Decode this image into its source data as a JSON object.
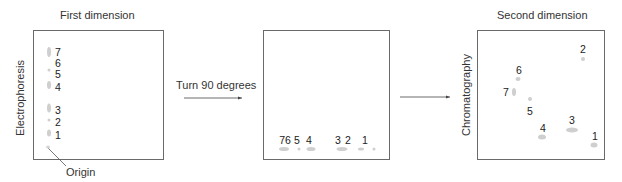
{
  "panels": [
    {
      "title": "First dimension",
      "axis_label": "Electrophoresis",
      "labels": [
        {
          "text": "7",
          "x": 58,
          "y": 52
        },
        {
          "text": "6",
          "x": 58,
          "y": 63
        },
        {
          "text": "5",
          "x": 58,
          "y": 74
        },
        {
          "text": "4",
          "x": 58,
          "y": 87
        },
        {
          "text": "3",
          "x": 58,
          "y": 110
        },
        {
          "text": "2",
          "x": 58,
          "y": 122
        },
        {
          "text": "1",
          "x": 58,
          "y": 135
        }
      ],
      "spots": [
        {
          "x": 49,
          "y": 52,
          "w": 4,
          "h": 10
        },
        {
          "x": 49,
          "y": 70,
          "w": 3,
          "h": 3
        },
        {
          "x": 49,
          "y": 85,
          "w": 4,
          "h": 8
        },
        {
          "x": 49,
          "y": 108,
          "w": 4,
          "h": 9
        },
        {
          "x": 49,
          "y": 120,
          "w": 3,
          "h": 3
        },
        {
          "x": 49,
          "y": 133,
          "w": 4,
          "h": 7
        }
      ],
      "origin_label": "Origin"
    },
    {
      "title": "",
      "labels": [
        {
          "text": "76",
          "x": 285,
          "y": 140
        },
        {
          "text": "5",
          "x": 297,
          "y": 140
        },
        {
          "text": "4",
          "x": 309,
          "y": 140
        },
        {
          "text": "3",
          "x": 338,
          "y": 140
        },
        {
          "text": "2",
          "x": 348,
          "y": 140
        },
        {
          "text": "1",
          "x": 365,
          "y": 140
        }
      ],
      "spots": [
        {
          "x": 284,
          "y": 149,
          "w": 10,
          "h": 4
        },
        {
          "x": 299,
          "y": 149,
          "w": 3,
          "h": 3
        },
        {
          "x": 311,
          "y": 149,
          "w": 9,
          "h": 4
        },
        {
          "x": 342,
          "y": 149,
          "w": 11,
          "h": 4
        },
        {
          "x": 361,
          "y": 149,
          "w": 6,
          "h": 3
        },
        {
          "x": 374,
          "y": 149,
          "w": 3,
          "h": 3
        }
      ]
    },
    {
      "title": "Second dimension",
      "axis_label": "Chromatography",
      "labels": [
        {
          "text": "2",
          "x": 583,
          "y": 49
        },
        {
          "text": "6",
          "x": 519,
          "y": 70
        },
        {
          "text": "7",
          "x": 506,
          "y": 92
        },
        {
          "text": "5",
          "x": 530,
          "y": 111
        },
        {
          "text": "4",
          "x": 543,
          "y": 128
        },
        {
          "text": "3",
          "x": 572,
          "y": 120
        },
        {
          "text": "1",
          "x": 595,
          "y": 136
        }
      ],
      "spots": [
        {
          "x": 583,
          "y": 59,
          "w": 4,
          "h": 4
        },
        {
          "x": 518,
          "y": 79,
          "w": 5,
          "h": 4
        },
        {
          "x": 514,
          "y": 92,
          "w": 4,
          "h": 8
        },
        {
          "x": 530,
          "y": 99,
          "w": 4,
          "h": 4
        },
        {
          "x": 542,
          "y": 137,
          "w": 8,
          "h": 5
        },
        {
          "x": 572,
          "y": 130,
          "w": 12,
          "h": 5
        },
        {
          "x": 594,
          "y": 145,
          "w": 7,
          "h": 5
        }
      ]
    }
  ],
  "arrows": [
    {
      "label": "Turn 90 degrees"
    },
    {
      "label": ""
    }
  ]
}
